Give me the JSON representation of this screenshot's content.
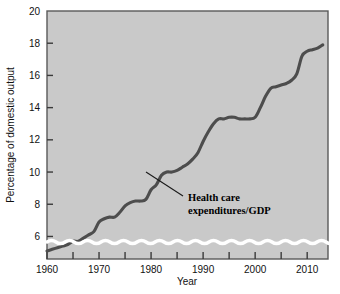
{
  "figure": {
    "background_color": "#ffffff",
    "plot_background_color": "#c9c9c9",
    "frame_color": "#4a4a4a",
    "line_color": "#4d4d4d",
    "text_color": "#111111",
    "axis_break_color": "#ffffff"
  },
  "chart_data": {
    "type": "line",
    "title": "",
    "xlabel": "Year",
    "ylabel": "Percentage of domestic output",
    "xlim": [
      1960,
      2014
    ],
    "ylim": [
      4.6,
      20
    ],
    "grid": false,
    "legend_position": "none",
    "y_axis_break": true,
    "y_tick_labels": [
      "6",
      "8",
      "10",
      "12",
      "14",
      "16",
      "18",
      "20"
    ],
    "y_ticks": [
      6,
      8,
      10,
      12,
      14,
      16,
      18,
      20
    ],
    "x_tick_labels": [
      "1960",
      "1970",
      "1980",
      "1990",
      "2000",
      "2010"
    ],
    "x_ticks_major": [
      1960,
      1970,
      1980,
      1990,
      2000,
      2010
    ],
    "x_ticks_minor": [
      1965,
      1975,
      1985,
      1995,
      2005
    ],
    "series": [
      {
        "name": "Health care expenditures/GDP",
        "annotation": "Health care\nexpenditures/GDP",
        "annotation_line1": "Health care",
        "annotation_line2": "expenditures/GDP",
        "x": [
          1960,
          1961,
          1962,
          1963,
          1964,
          1965,
          1966,
          1967,
          1968,
          1969,
          1970,
          1971,
          1972,
          1973,
          1974,
          1975,
          1976,
          1977,
          1978,
          1979,
          1980,
          1981,
          1982,
          1983,
          1984,
          1985,
          1986,
          1987,
          1988,
          1989,
          1990,
          1991,
          1992,
          1993,
          1994,
          1995,
          1996,
          1997,
          1998,
          1999,
          2000,
          2001,
          2002,
          2003,
          2004,
          2005,
          2006,
          2007,
          2008,
          2009,
          2010,
          2011,
          2012,
          2013
        ],
        "y": [
          5.1,
          5.2,
          5.3,
          5.4,
          5.5,
          5.7,
          5.7,
          5.9,
          6.1,
          6.3,
          6.9,
          7.1,
          7.2,
          7.2,
          7.5,
          7.9,
          8.1,
          8.2,
          8.2,
          8.3,
          8.9,
          9.2,
          9.8,
          10.0,
          10.0,
          10.1,
          10.3,
          10.5,
          10.8,
          11.2,
          11.9,
          12.5,
          13.0,
          13.3,
          13.3,
          13.4,
          13.4,
          13.3,
          13.3,
          13.3,
          13.4,
          14.0,
          14.7,
          15.2,
          15.3,
          15.4,
          15.5,
          15.7,
          16.1,
          17.2,
          17.5,
          17.6,
          17.7,
          17.9
        ]
      }
    ]
  }
}
